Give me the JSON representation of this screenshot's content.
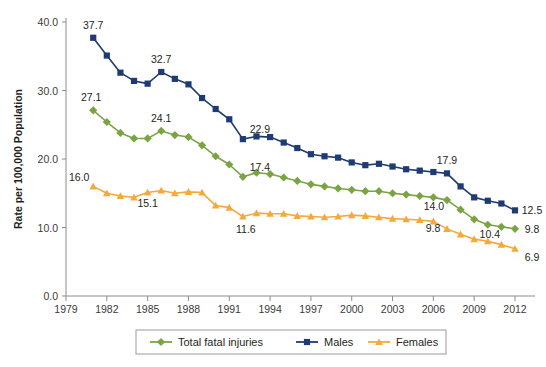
{
  "chart_data": {
    "type": "line",
    "title": "",
    "xlabel": "",
    "ylabel": "Rate per 100,000 Population",
    "ylim": [
      0.0,
      40.0
    ],
    "xlim": [
      1979,
      2012
    ],
    "ytick_labels": [
      "0.0",
      "10.0",
      "20.0",
      "30.0",
      "40.0"
    ],
    "ytick_values": [
      0.0,
      10.0,
      20.0,
      30.0,
      40.0
    ],
    "xtick_labels": [
      "1979",
      "1982",
      "1985",
      "1988",
      "1991",
      "1994",
      "1997",
      "2000",
      "2003",
      "2006",
      "2009",
      "2012"
    ],
    "xtick_values": [
      1979,
      1982,
      1985,
      1988,
      1991,
      1994,
      1997,
      2000,
      2003,
      2006,
      2009,
      2012
    ],
    "grid": false,
    "legend_position": "bottom",
    "x": [
      1981,
      1982,
      1983,
      1984,
      1985,
      1986,
      1987,
      1988,
      1989,
      1990,
      1991,
      1992,
      1993,
      1994,
      1995,
      1996,
      1997,
      1998,
      1999,
      2000,
      2001,
      2002,
      2003,
      2004,
      2005,
      2006,
      2007,
      2008,
      2009,
      2010,
      2011,
      2012
    ],
    "series": [
      {
        "name": "Total fatal injuries",
        "color": "#7aa444",
        "marker": "diamond",
        "values": [
          27.1,
          25.4,
          23.8,
          23.0,
          23.0,
          24.1,
          23.5,
          23.2,
          22.0,
          20.4,
          19.2,
          17.4,
          18.0,
          17.8,
          17.3,
          16.8,
          16.3,
          16.0,
          15.7,
          15.5,
          15.3,
          15.3,
          15.0,
          14.8,
          14.6,
          14.4,
          14.0,
          12.6,
          11.2,
          10.4,
          10.1,
          9.8
        ]
      },
      {
        "name": "Males",
        "color": "#1f3b73",
        "marker": "square",
        "values": [
          37.7,
          35.1,
          32.6,
          31.4,
          31.0,
          32.7,
          31.7,
          30.9,
          28.9,
          27.3,
          25.8,
          22.9,
          23.3,
          23.2,
          22.4,
          21.6,
          20.7,
          20.4,
          20.2,
          19.5,
          19.1,
          19.3,
          18.9,
          18.5,
          18.3,
          18.1,
          17.9,
          16.0,
          14.4,
          13.9,
          13.5,
          12.5
        ]
      },
      {
        "name": "Females",
        "color": "#f5a83c",
        "marker": "triangle",
        "values": [
          16.0,
          15.0,
          14.6,
          14.4,
          15.1,
          15.4,
          15.0,
          15.2,
          15.1,
          13.2,
          12.9,
          11.6,
          12.1,
          12.0,
          12.0,
          11.7,
          11.6,
          11.5,
          11.6,
          11.8,
          11.7,
          11.5,
          11.3,
          11.2,
          11.1,
          10.9,
          9.8,
          9.0,
          8.3,
          8.0,
          7.5,
          6.9
        ]
      }
    ],
    "point_labels": [
      {
        "series": "Males",
        "x": 1981,
        "value": "37.7",
        "dx": 0,
        "dy": -9
      },
      {
        "series": "Males",
        "x": 1986,
        "value": "32.7",
        "dx": 0,
        "dy": -9
      },
      {
        "series": "Males",
        "x": 1992,
        "value": "22.9",
        "dx": 17,
        "dy": -6
      },
      {
        "series": "Males",
        "x": 2007,
        "value": "17.9",
        "dx": 0,
        "dy": -9
      },
      {
        "series": "Males",
        "x": 2012,
        "value": "12.5",
        "dx": 17,
        "dy": 4
      },
      {
        "series": "Total fatal injuries",
        "x": 1981,
        "value": "27.1",
        "dx": -2,
        "dy": -9
      },
      {
        "series": "Total fatal injuries",
        "x": 1986,
        "value": "24.1",
        "dx": 0,
        "dy": -9
      },
      {
        "series": "Total fatal injuries",
        "x": 1992,
        "value": "17.4",
        "dx": 17,
        "dy": -6
      },
      {
        "series": "Total fatal injuries",
        "x": 2007,
        "value": "14.0",
        "dx": -13,
        "dy": 10
      },
      {
        "series": "Total fatal injuries",
        "x": 2010,
        "value": "10.4",
        "dx": 2,
        "dy": 13
      },
      {
        "series": "Total fatal injuries",
        "x": 2012,
        "value": "9.8",
        "dx": 17,
        "dy": 4
      },
      {
        "series": "Females",
        "x": 1981,
        "value": "16.0",
        "dx": -14,
        "dy": -5
      },
      {
        "series": "Females",
        "x": 1985,
        "value": "15.1",
        "dx": 0,
        "dy": 14
      },
      {
        "series": "Females",
        "x": 1992,
        "value": "11.6",
        "dx": 3,
        "dy": 16
      },
      {
        "series": "Females",
        "x": 2007,
        "value": "9.8",
        "dx": -14,
        "dy": 3
      },
      {
        "series": "Females",
        "x": 2012,
        "value": "6.9",
        "dx": 17,
        "dy": 12
      }
    ],
    "legend": [
      {
        "label": "Total fatal injuries",
        "color": "#7aa444",
        "marker": "diamond"
      },
      {
        "label": "Males",
        "color": "#1f3b73",
        "marker": "square"
      },
      {
        "label": "Females",
        "color": "#f5a83c",
        "marker": "triangle"
      }
    ]
  }
}
